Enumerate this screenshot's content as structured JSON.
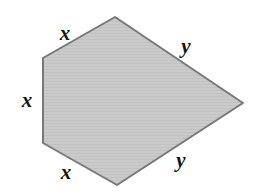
{
  "figure": {
    "background_color": "#ffffff",
    "shape": {
      "name": "hexagon",
      "fill_color": "#c9c9c9",
      "stroke_color": "#787878",
      "stroke_width": 2,
      "texture": "faint-horizontal-stripes",
      "vertices": [
        {
          "name": "apex-top",
          "x": 115,
          "y": 17
        },
        {
          "name": "upper-left",
          "x": 43,
          "y": 58
        },
        {
          "name": "lower-left",
          "x": 43,
          "y": 143
        },
        {
          "name": "bottom",
          "x": 117,
          "y": 185
        },
        {
          "name": "right-point",
          "x": 243,
          "y": 103
        }
      ],
      "points_string": "115,17 43,58 43,143 117,185 243,103"
    },
    "labels": [
      {
        "name": "x-top-left-side",
        "text": "x",
        "x": 65,
        "y": 33
      },
      {
        "name": "x-left-side",
        "text": "x",
        "x": 27,
        "y": 100
      },
      {
        "name": "x-bottom-left-side",
        "text": "x",
        "x": 66,
        "y": 172
      },
      {
        "name": "y-top-right-side",
        "text": "y",
        "x": 186,
        "y": 46
      },
      {
        "name": "y-bottom-right-side",
        "text": "y",
        "x": 181,
        "y": 160
      }
    ]
  }
}
